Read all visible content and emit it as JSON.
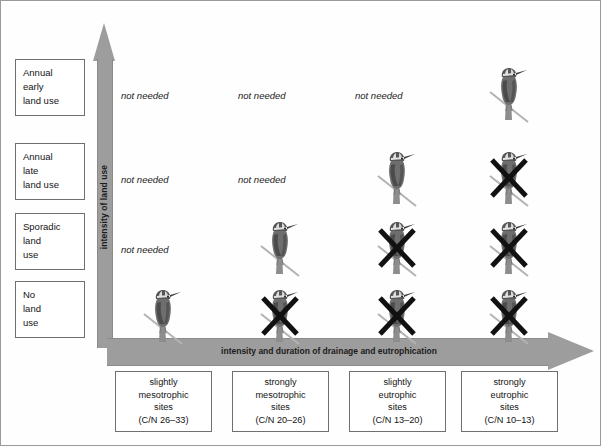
{
  "figure": {
    "y_axis_label": "intensity of land use",
    "x_axis_label": "intensity and duration of drainage and eutrophication",
    "not_needed_text": "not needed"
  },
  "rows": [
    {
      "line1": "Annual",
      "line2": "early",
      "line3": "land use"
    },
    {
      "line1": "Annual",
      "line2": "late",
      "line3": "land use"
    },
    {
      "line1": "Sporadic",
      "line2": "land",
      "line3": "use"
    },
    {
      "line1": "No",
      "line2": "land",
      "line3": "use"
    }
  ],
  "columns": [
    {
      "line1": "slightly",
      "line2": "mesotrophic",
      "line3": "sites",
      "line4": "(C/N 26–33)"
    },
    {
      "line1": "strongly",
      "line2": "mesotrophic",
      "line3": "sites",
      "line4": "(C/N 20–26)"
    },
    {
      "line1": "slightly",
      "line2": "eutrophic",
      "line3": "sites",
      "line4": "(C/N 13–20)"
    },
    {
      "line1": "strongly",
      "line2": "eutrophic",
      "line3": "sites",
      "line4": "(C/N 10–13)"
    }
  ],
  "chart_data": {
    "type": "table",
    "title": "",
    "xlabel": "intensity and duration of drainage and eutrophication",
    "ylabel": "intensity of land use",
    "row_categories": [
      "Annual early land use",
      "Annual late land use",
      "Sporadic land use",
      "No land use"
    ],
    "column_categories": [
      "slightly mesotrophic sites (C/N 26–33)",
      "strongly mesotrophic sites (C/N 20–26)",
      "slightly eutrophic sites (C/N 13–20)",
      "strongly eutrophic sites (C/N 10–13)"
    ],
    "cell_states": [
      [
        "not needed",
        "not needed",
        "not needed",
        "bird"
      ],
      [
        "not needed",
        "not needed",
        "bird",
        "bird-crossed"
      ],
      [
        "not needed",
        "bird",
        "bird-crossed",
        "bird-crossed"
      ],
      [
        "bird",
        "bird-crossed",
        "bird-crossed",
        "bird-crossed"
      ]
    ],
    "legend": [
      "bird = habitat suitable",
      "bird-crossed = habitat lost",
      "not needed = management not needed"
    ],
    "grid": false
  },
  "colors": {
    "arrow": "#9d9d9d",
    "border": "#6f6f6f",
    "text": "#141414",
    "cross": "#111111",
    "background": "#ffffff"
  }
}
